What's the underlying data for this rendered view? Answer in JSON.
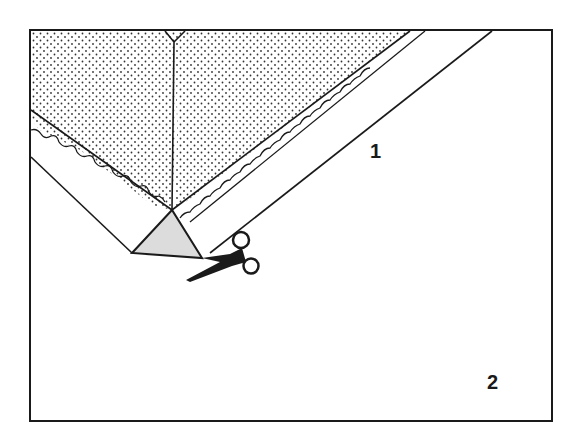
{
  "diagram": {
    "colors": {
      "ink": "#1a1a1a",
      "fabric_fill": "#ffffff",
      "fold_fill": "#dcdcdc",
      "background": "#ffffff"
    },
    "steps": [
      {
        "label": "1",
        "description": "Corner folded into triangle; triangle tip is cut off with scissors"
      },
      {
        "label": "2",
        "description": "Trimmed corner shown as trapezoid with dash-dot fold lines"
      }
    ],
    "icons": [
      "scissors-icon"
    ]
  }
}
